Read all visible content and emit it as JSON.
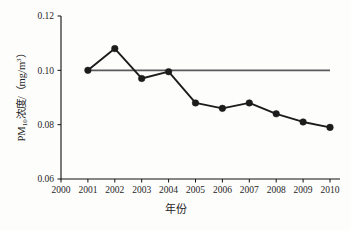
{
  "chart_data": {
    "type": "line",
    "title": "",
    "xlabel": "年份",
    "ylabel": "PM10浓度/（mg/m3）",
    "ylabel_parts": {
      "prefix": "PM",
      "subscript": "10",
      "middle": "浓度/（mg/m",
      "superscript": "3",
      "suffix": "）"
    },
    "x": [
      2000,
      2001,
      2002,
      2003,
      2004,
      2005,
      2006,
      2007,
      2008,
      2009,
      2010
    ],
    "xtick_labels": [
      "2000",
      "2001",
      "2002",
      "2003",
      "2004",
      "2005",
      "2006",
      "2007",
      "2008",
      "2009",
      "2010"
    ],
    "ytick_labels": [
      "0.06",
      "0.08",
      "0.10",
      "0.12"
    ],
    "yticks": [
      0.06,
      0.08,
      0.1,
      0.12
    ],
    "ylim": [
      0.06,
      0.12
    ],
    "xlim": [
      2000,
      2010
    ],
    "grid": false,
    "legend": "none",
    "series": [
      {
        "name": "PM10浓度",
        "marker": "filled-circle",
        "color": "#1c1c1c",
        "x": [
          2001,
          2002,
          2003,
          2004,
          2005,
          2006,
          2007,
          2008,
          2009,
          2010
        ],
        "values": [
          0.1,
          0.108,
          0.097,
          0.0995,
          0.088,
          0.086,
          0.088,
          0.084,
          0.081,
          0.079
        ]
      }
    ],
    "reference_line": {
      "name": "标准限值",
      "value": 0.1,
      "orientation": "horizontal",
      "color": "#5a5a5a",
      "x_start": 2001,
      "x_end": 2010
    }
  }
}
